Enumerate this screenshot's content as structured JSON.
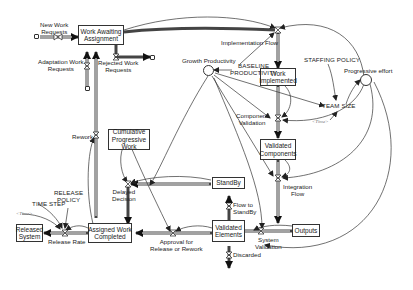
{
  "diagram": {
    "type": "stock-and-flow",
    "stocks": {
      "work_awaiting_assignment": "Work Awaiting\nAssignment",
      "work_implemented": "Work\nImplemented",
      "validated_components": "Validated\nComponents",
      "cumulative_progressive_work": "Cumulative\nProgressive\nWork",
      "standby": "StandBy",
      "validated_elements": "Validated\nElements",
      "outputs": "Outputs",
      "assigned_work_completed": "Assigned Work\nCompleted",
      "released_system": "Released\nSystem"
    },
    "flows": {
      "new_work_requests": "New Work\nRequests",
      "adaptation_work_requests": "Adaptation Work\nRequests",
      "rejected_work_requests": "Rejected Work\nRequests",
      "implementation_flow": "Implementation Flow",
      "component_validation": "Component\nValidation",
      "integration_flow": "Integration\nFlow",
      "system_validation": "System\nValidation",
      "flow_to_standby": "Flow to\nStandBy",
      "discarded": "Discarded",
      "approval": "Approval for\nRelease or Rework",
      "delayed_decision": "Delayed\nDecision",
      "rework": "Rework",
      "release_rate": "Release Rate"
    },
    "auxiliaries": {
      "growth_productivity": "Growth Productivity",
      "baseline_productivity": "BASELINE\nPRODUCTIVITY",
      "staffing_policy": "STAFFING POLICY",
      "progressive_effort": "Progressive effort",
      "team_size": "TEAM SIZE",
      "time_ref_team": "<Time>",
      "time_step": "TIME STEP",
      "release_policy": "RELEASE\nPOLICY",
      "time_ref_release": "<Time>"
    }
  }
}
